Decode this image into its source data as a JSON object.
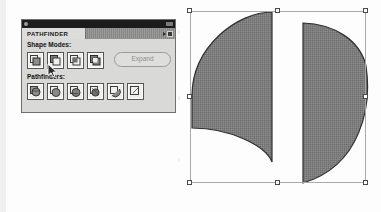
{
  "app": {
    "name": "Adobe Illustrator",
    "panel_title": "PATHFINDER"
  },
  "panel": {
    "tab_label": "PATHFINDER",
    "menu_icon": "panel-menu-icon",
    "titlebar_dot": "window-dot",
    "sections": [
      {
        "label": "Shape Modes:"
      },
      {
        "label": "Pathfinders:"
      }
    ],
    "shape_modes": [
      {
        "name": "unite",
        "icon": "unite-icon"
      },
      {
        "name": "minus-front",
        "icon": "minus-front-icon"
      },
      {
        "name": "intersect",
        "icon": "intersect-icon"
      },
      {
        "name": "exclude",
        "icon": "exclude-icon"
      }
    ],
    "expand": {
      "label": "Expand",
      "enabled": false
    },
    "pathfinders": [
      {
        "name": "divide",
        "icon": "divide-icon"
      },
      {
        "name": "trim",
        "icon": "trim-icon"
      },
      {
        "name": "merge",
        "icon": "merge-icon"
      },
      {
        "name": "crop",
        "icon": "crop-icon"
      },
      {
        "name": "outline",
        "icon": "outline-icon"
      },
      {
        "name": "minus-back",
        "icon": "minus-back-icon"
      }
    ]
  },
  "cursor": {
    "icon": "arrow-pointer-cursor",
    "x": 47,
    "y": 63,
    "over": "minus-front"
  },
  "canvas": {
    "selection": {
      "x": 190,
      "y": 11,
      "width": 176,
      "height": 172,
      "handle_count": 8
    },
    "shapes": [
      {
        "name": "left-crescent-shape",
        "fill": "#7a7a7a",
        "stroke": "#2e2e2e",
        "description": "quarter-disc with concave bottom bite, flat right edge"
      },
      {
        "name": "right-half-disc-shape",
        "fill": "#7a7a7a",
        "stroke": "#2e2e2e",
        "description": "half circle, flat vertical left edge, curve bulging right"
      }
    ]
  },
  "colors": {
    "panel_background": "#d9d9d8",
    "panel_border": "#6f6f6f",
    "titlebar": "#1c1c1c",
    "tab_active": "#dcdcdb",
    "tab_inactive": "#8b8b8b",
    "button_face": "#efefee",
    "shape_fill": "#7a7a7a",
    "shape_stroke": "#2e2e2e",
    "selection_border": "#a9a9a9",
    "handle_fill": "#ffffff",
    "disabled_text": "#8d8d8d",
    "page_background": "#fdfdfd"
  }
}
